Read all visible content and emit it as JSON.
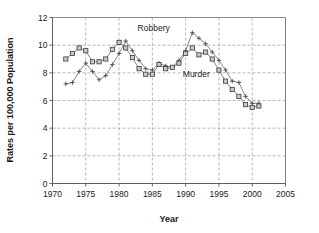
{
  "chart_data": {
    "type": "line",
    "title": "",
    "xlabel": "Year",
    "ylabel": "Rates per 100,000 Population",
    "xlim": [
      1970,
      2005
    ],
    "ylim": [
      0,
      12
    ],
    "xticks": [
      1970,
      1975,
      1980,
      1985,
      1990,
      1995,
      2000,
      2005
    ],
    "yticks": [
      0,
      2,
      4,
      6,
      8,
      10,
      12
    ],
    "grid": true,
    "legend_position": "inline-annotation",
    "annotations": [
      {
        "text": "Robbery",
        "x": 1985.2,
        "y": 11.0
      },
      {
        "text": "Murder",
        "x": 1991.6,
        "y": 7.7
      }
    ],
    "series": [
      {
        "name": "Robbery",
        "marker": "plus",
        "x": [
          1972,
          1973,
          1974,
          1975,
          1976,
          1977,
          1978,
          1979,
          1980,
          1981,
          1982,
          1983,
          1984,
          1985,
          1986,
          1987,
          1988,
          1989,
          1990,
          1991,
          1992,
          1993,
          1994,
          1995,
          1996,
          1997,
          1998,
          1999,
          2000,
          2001
        ],
        "values": [
          7.2,
          7.3,
          8.1,
          8.7,
          8.1,
          7.5,
          7.8,
          8.6,
          9.4,
          10.3,
          9.6,
          8.9,
          8.3,
          8.2,
          8.7,
          8.5,
          8.4,
          8.9,
          9.6,
          10.9,
          10.5,
          10.1,
          9.5,
          8.9,
          8.2,
          7.4,
          7.3,
          6.3,
          5.8,
          5.8
        ]
      },
      {
        "name": "Murder",
        "marker": "square",
        "x": [
          1972,
          1973,
          1974,
          1975,
          1976,
          1977,
          1978,
          1979,
          1980,
          1981,
          1982,
          1983,
          1984,
          1985,
          1986,
          1987,
          1988,
          1989,
          1990,
          1991,
          1992,
          1993,
          1994,
          1995,
          1996,
          1997,
          1998,
          1999,
          2000,
          2001
        ],
        "values": [
          9.0,
          9.4,
          9.8,
          9.6,
          8.8,
          8.8,
          9.0,
          9.7,
          10.2,
          9.8,
          9.1,
          8.3,
          7.9,
          7.9,
          8.6,
          8.3,
          8.4,
          8.7,
          9.4,
          9.8,
          9.3,
          9.5,
          9.0,
          8.2,
          7.4,
          6.8,
          6.3,
          5.7,
          5.5,
          5.6
        ]
      }
    ]
  }
}
